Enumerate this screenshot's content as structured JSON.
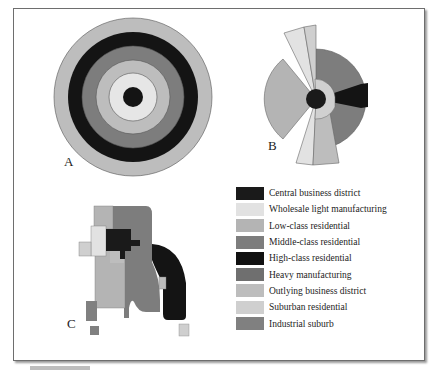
{
  "colors": {
    "cbd": "#1a1a1a",
    "wholesale": "#e2e2e2",
    "low_class": "#b4b4b4",
    "middle_class": "#7d7d7d",
    "high_class": "#111111",
    "heavy_mfg": "#6f6f6f",
    "outlying_bd": "#bdbdbd",
    "suburban": "#cfcfcf",
    "industrial_suburb": "#808080"
  },
  "panels": {
    "a": {
      "label": "A"
    },
    "b": {
      "label": "B"
    },
    "c": {
      "label": "C"
    }
  },
  "legend": {
    "items": [
      {
        "label": "Central business district",
        "color": "#1a1a1a"
      },
      {
        "label": "Wholesale light manufacturing",
        "color": "#e2e2e2"
      },
      {
        "label": "Low-class residential",
        "color": "#b4b4b4"
      },
      {
        "label": "Middle-class residential",
        "color": "#7d7d7d"
      },
      {
        "label": "High-class residential",
        "color": "#111111"
      },
      {
        "label": "Heavy manufacturing",
        "color": "#6f6f6f"
      },
      {
        "label": "Outlying business district",
        "color": "#bdbdbd"
      },
      {
        "label": "Suburban residential",
        "color": "#cfcfcf"
      },
      {
        "label": "Industrial suburb",
        "color": "#808080"
      }
    ]
  }
}
